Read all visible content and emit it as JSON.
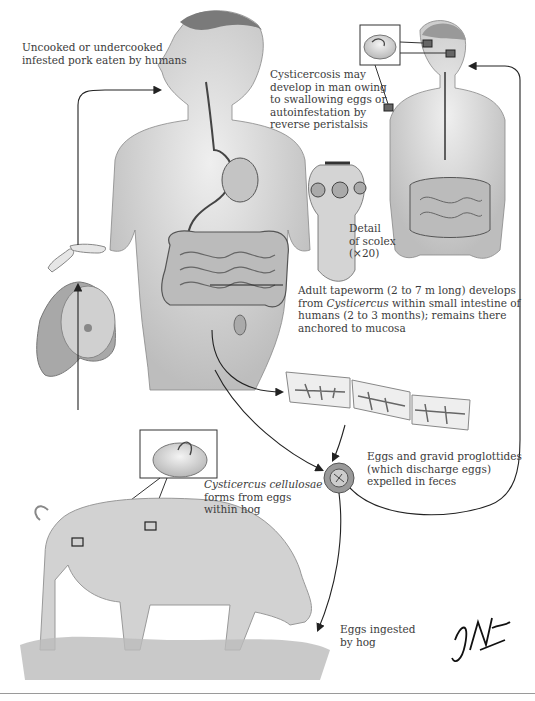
{
  "labels": {
    "pork": [
      "Uncooked or undercooked",
      "infested pork eaten by humans"
    ],
    "cysticercosis": [
      "Cysticercosis may",
      "develop in man owing",
      "to swallowing eggs or",
      "autoinfestation by",
      "reverse peristalsis"
    ],
    "scolex": [
      "Detail",
      "of scolex",
      "(×20)"
    ],
    "adult": {
      "line1": "Adult tapeworm (2 to 7 m long) develops",
      "line2_pre": "from ",
      "line2_italic": "Cysticercus",
      "line2_post": " within small intestine of",
      "line3": "humans (2 to 3 months); remains there",
      "line4": "anchored to mucosa"
    },
    "eggs": [
      "Eggs and gravid proglottides",
      "(which discharge eggs)",
      "expelled in feces"
    ],
    "cyst": {
      "italic": "Cysticercus cellulosae",
      "line2": "forms from eggs",
      "line3": "within hog"
    },
    "ingested": [
      "Eggs ingested",
      "by hog"
    ],
    "signature": "F. Netter M.D."
  },
  "colors": {
    "line": "#222222",
    "skin": "#d9d9d9",
    "gut": "#b5b5b5",
    "text": "#3b3b3b"
  }
}
